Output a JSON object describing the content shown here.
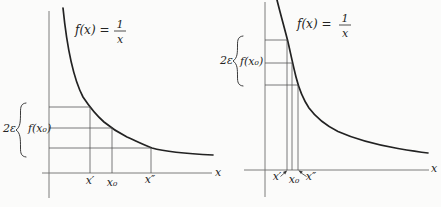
{
  "figure": {
    "description_labels": {
      "background_color": "#fbfbfa",
      "ink_color": "#222222",
      "axis_color": "#6e6e6e"
    },
    "panels": [
      {
        "id": "left",
        "function_label": "f(x) =",
        "fraction": {
          "numerator": "1",
          "denominator": "x"
        },
        "epsilon_label": "2ε",
        "value_label": "f(x₀)",
        "axis_label": "x",
        "ticks": {
          "x_prime": "x′",
          "x_zero": "x₀",
          "x_double_prime": "x″"
        }
      },
      {
        "id": "right",
        "function_label": "f(x) =",
        "fraction": {
          "numerator": "1",
          "denominator": "x"
        },
        "epsilon_label": "2ε",
        "value_label": "f(x₀)",
        "axis_label": "x",
        "ticks": {
          "x_prime": "x′",
          "x_zero": "x₀",
          "x_double_prime": "x″"
        }
      }
    ]
  }
}
